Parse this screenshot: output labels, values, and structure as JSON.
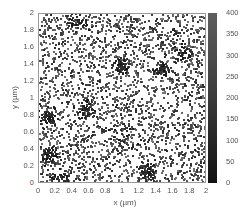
{
  "chart_data": {
    "type": "scatter",
    "title": "",
    "xlabel": "x (µm)",
    "ylabel": "y (µm)",
    "xlim": [
      0,
      2
    ],
    "ylim": [
      0,
      2
    ],
    "x_ticks": [
      "0",
      "0.2",
      "0.4",
      "0.6",
      "0.8",
      "1",
      "1.2",
      "1.4",
      "1.6",
      "1.8",
      "2"
    ],
    "y_ticks": [
      "0",
      "0.2",
      "0.4",
      "0.6",
      "0.8",
      "1",
      "1.2",
      "1.4",
      "1.6",
      "1.8",
      "2"
    ],
    "colorbar": {
      "range": [
        0,
        400
      ],
      "ticks": [
        "400",
        "350",
        "300",
        "250",
        "200",
        "150",
        "100",
        "50",
        "0"
      ],
      "colormap": "gray"
    },
    "grid": false,
    "background_points": 2600,
    "clusters": [
      {
        "x": 0.1,
        "y": 0.8,
        "spread": 0.045,
        "n": 70
      },
      {
        "x": 0.1,
        "y": 0.36,
        "spread": 0.05,
        "n": 55
      },
      {
        "x": 0.25,
        "y": 0.05,
        "spread": 0.05,
        "n": 50
      },
      {
        "x": 0.55,
        "y": 0.88,
        "spread": 0.05,
        "n": 45
      },
      {
        "x": 0.98,
        "y": 1.4,
        "spread": 0.045,
        "n": 60
      },
      {
        "x": 1.45,
        "y": 1.35,
        "spread": 0.04,
        "n": 55
      },
      {
        "x": 1.28,
        "y": 0.16,
        "spread": 0.05,
        "n": 55
      },
      {
        "x": 1.62,
        "y": 1.8,
        "spread": 0.02,
        "n": 15
      },
      {
        "x": 1.7,
        "y": 1.55,
        "spread": 0.06,
        "n": 35
      },
      {
        "x": 0.45,
        "y": 1.9,
        "spread": 0.06,
        "n": 35
      },
      {
        "x": 1.0,
        "y": 0.55,
        "spread": 0.08,
        "n": 30
      }
    ]
  }
}
